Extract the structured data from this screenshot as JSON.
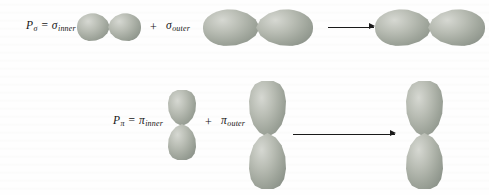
{
  "figure": {
    "background_color": "#fefefe",
    "ink_color": "#141414",
    "orbital_fill_light": "#d6d8d2",
    "orbital_fill_mid": "#9fa59b",
    "orbital_fill_dark": "#838a80"
  },
  "rows": [
    {
      "id": "sigma-row",
      "equation": {
        "symbol": "P",
        "symbol_subscript": "σ",
        "equals": "=",
        "first_term": "σ",
        "first_term_subscript": "inner",
        "plus": "+",
        "second_term": "σ",
        "second_term_subscript": "outer"
      },
      "orbitals": {
        "inner": {
          "name": "sigma-inner-orbital",
          "orientation": "horizontal",
          "size": "small"
        },
        "outer": {
          "name": "sigma-outer-orbital",
          "orientation": "horizontal",
          "size": "large"
        },
        "result": {
          "name": "sigma-result-orbital",
          "orientation": "horizontal",
          "size": "large"
        }
      },
      "arrow": {
        "name": "sigma-reaction-arrow",
        "direction": "right"
      }
    },
    {
      "id": "pi-row",
      "equation": {
        "symbol": "P",
        "symbol_subscript": "π",
        "equals": "=",
        "first_term": "π",
        "first_term_subscript": "inner",
        "plus": "+",
        "second_term": "π",
        "second_term_subscript": "outer"
      },
      "orbitals": {
        "inner": {
          "name": "pi-inner-orbital",
          "orientation": "vertical",
          "size": "small"
        },
        "outer": {
          "name": "pi-outer-orbital",
          "orientation": "vertical",
          "size": "large"
        },
        "result": {
          "name": "pi-result-orbital",
          "orientation": "vertical",
          "size": "large"
        }
      },
      "arrow": {
        "name": "pi-reaction-arrow",
        "direction": "right"
      }
    }
  ]
}
